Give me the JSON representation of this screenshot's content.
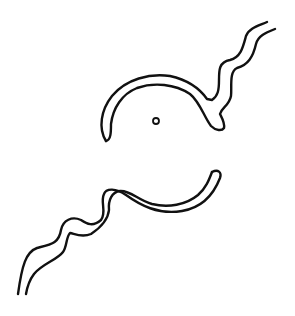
{
  "figure": {
    "colors": {
      "stroke": "#111111",
      "background": "#ffffff"
    },
    "parts": [
      {
        "name": "upper-arc-with-wavy-tail"
      },
      {
        "name": "center-dot"
      },
      {
        "name": "lower-arc-with-wavy-tail"
      }
    ]
  }
}
